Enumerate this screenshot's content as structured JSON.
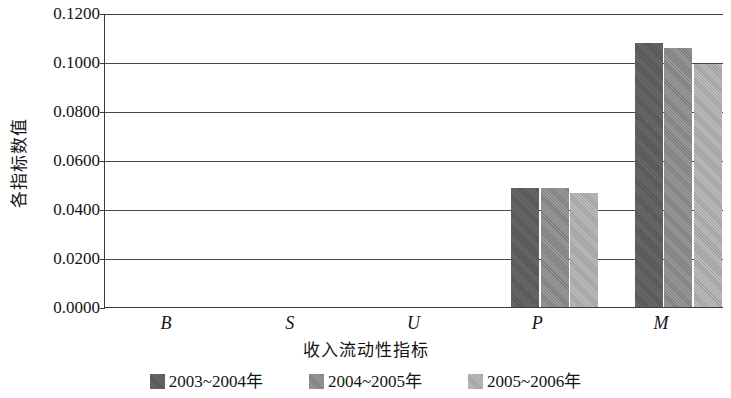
{
  "chart_data": {
    "type": "bar",
    "title": "",
    "xlabel": "收入流动性指标",
    "ylabel": "各指标数值",
    "categories": [
      "B",
      "S",
      "U",
      "P",
      "M"
    ],
    "ylim": [
      0.0,
      0.12
    ],
    "yticks": [
      "0.1200",
      "0.1000",
      "0.0800",
      "0.0600",
      "0.0400",
      "0.0200",
      "0.0000"
    ],
    "ytick_values": [
      0.12,
      0.1,
      0.08,
      0.06,
      0.04,
      0.02,
      0.0
    ],
    "grid": true,
    "legend_position": "bottom",
    "series": [
      {
        "name": "2003~2004年",
        "color": "#5d5d5d",
        "values": [
          0.0,
          0.0,
          0.0,
          0.0487,
          0.1078
        ]
      },
      {
        "name": "2004~2005年",
        "color": "#8c8c8c",
        "values": [
          0.0,
          0.0,
          0.0,
          0.0486,
          0.1058
        ]
      },
      {
        "name": "2005~2006年",
        "color": "#b0b0b0",
        "values": [
          0.0,
          0.0,
          0.0,
          0.0465,
          0.0992
        ]
      }
    ]
  },
  "axes": {
    "y_title": "各指标数值",
    "x_title": "收入流动性指标"
  },
  "legend": {
    "items": [
      {
        "label": "2003~2004年",
        "color": "#5d5d5d"
      },
      {
        "label": "2004~2005年",
        "color": "#8c8c8c"
      },
      {
        "label": "2005~2006年",
        "color": "#b0b0b0"
      }
    ]
  },
  "colors": {
    "series_1": "#5d5d5d",
    "series_2": "#8c8c8c",
    "series_3": "#b0b0b0",
    "axis": "#3c3c3c",
    "grid": "#4a4a4a",
    "text": "#141414",
    "background": "#ffffff"
  }
}
